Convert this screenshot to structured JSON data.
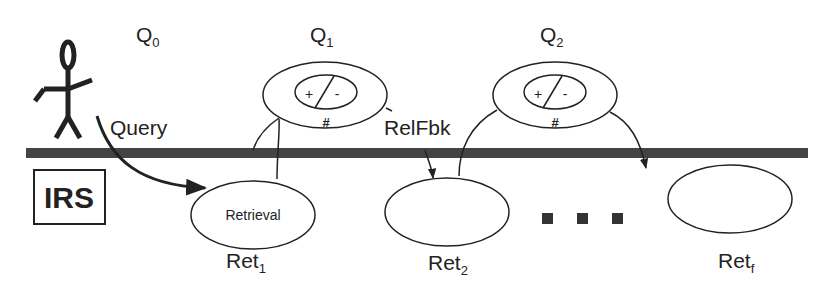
{
  "diagram": {
    "type": "relevance-feedback-process",
    "colors": {
      "ink": "#222222",
      "bar": "#444444",
      "background": "#ffffff"
    },
    "actor": {
      "icon": "stick-figure-user-icon"
    },
    "system_box": {
      "label": "IRS"
    },
    "queries": [
      {
        "base": "Q",
        "sub": "0"
      },
      {
        "base": "Q",
        "sub": "1"
      },
      {
        "base": "Q",
        "sub": "2"
      }
    ],
    "feedback_nodes": [
      {
        "plus": "+",
        "minus": "-",
        "count": "#"
      },
      {
        "plus": "+",
        "minus": "-",
        "count": "#"
      }
    ],
    "edge_labels": {
      "query": "Query",
      "relfbk": "RelFbk"
    },
    "retrievals": [
      {
        "inner_label": "Retrieval",
        "base": "Ret",
        "sub": "1"
      },
      {
        "inner_label": "",
        "base": "Ret",
        "sub": "2"
      },
      {
        "inner_label": "",
        "base": "Ret",
        "sub": "f"
      }
    ],
    "ellipsis": "■ ■ ■"
  }
}
